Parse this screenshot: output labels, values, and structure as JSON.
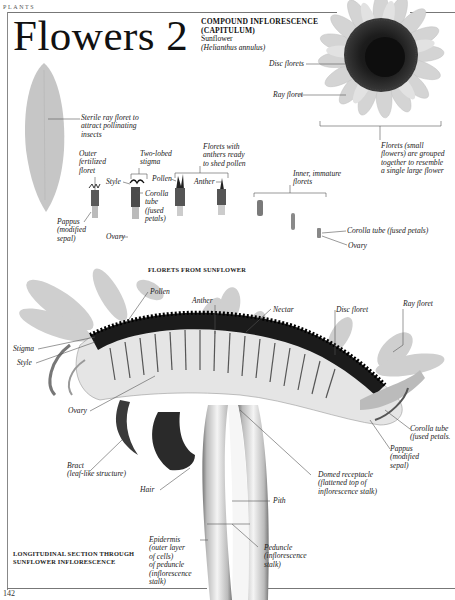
{
  "page": {
    "section": "PLANTS",
    "title": "Flowers 2",
    "page_number": "142"
  },
  "header_block": {
    "heading_line1": "COMPOUND INFLORESCENCE",
    "heading_line2": "(CAPITULUM)",
    "common_name": "Sunflower",
    "latin_name": "(Helianthus annulus)"
  },
  "top_labels": {
    "disc_florets": "Disc florets",
    "ray_floret": "Ray floret",
    "florets_grouped": [
      "Florets (small",
      "flowers) are grouped",
      "together to resemble",
      "a single large flower"
    ]
  },
  "florets_labels": {
    "sterile_ray": [
      "Sterile ray floret to",
      "attract pollinating",
      "insects"
    ],
    "outer_fertilized": [
      "Outer",
      "fertilized",
      "floret"
    ],
    "two_lobed_stigma": [
      "Two-lobed",
      "stigma"
    ],
    "style": "Style",
    "pollen": "Pollen",
    "corolla_tube": [
      "Corolla",
      "tube",
      "(fused",
      "petals)"
    ],
    "florets_anthers": [
      "Florets with",
      "anthers ready",
      "to shed pollen"
    ],
    "anther": "Anther",
    "inner_immature": [
      "Inner, immature",
      "florets"
    ],
    "pappus": [
      "Pappus",
      "(modified",
      "sepal)"
    ],
    "ovary": "Ovary",
    "corolla_tube_right": "Corolla tube (fused petals)",
    "ovary_right": "Ovary",
    "caption": "FLORETS FROM SUNFLOWER"
  },
  "section_labels": {
    "pollen": "Pollen",
    "anther": "Anther",
    "nectar": "Nectar",
    "disc_floret": "Disc floret",
    "ray_floret": "Ray floret",
    "stigma": "Stigma",
    "style": "Style",
    "ovary": "Ovary",
    "corolla_tube": [
      "Corolla tube",
      "(fused petals."
    ],
    "pappus": [
      "Pappus",
      "(modified",
      "sepal)"
    ],
    "bract": [
      "Bract",
      "(leaf-like structure)"
    ],
    "hair": "Hair",
    "domed_receptacle": [
      "Domed receptacle",
      "(flattened top of",
      "inflorescence stalk)"
    ],
    "pith": "Pith",
    "epidermis": [
      "Epidermis",
      "(outer layer",
      "of cells)",
      "of peduncle",
      "(inflorescence",
      "stalk)"
    ],
    "peduncle": [
      "Peduncle",
      "(inflorescence",
      "stalk)"
    ],
    "caption": [
      "LONGITUDINAL SECTION THROUGH",
      "SUNFLOWER INFLORESCENCE"
    ]
  }
}
